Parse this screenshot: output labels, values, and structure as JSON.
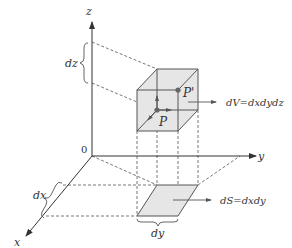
{
  "diagram": {
    "axes": {
      "z_label": "z",
      "y_label": "y",
      "x_label": "x",
      "origin_label": "0"
    },
    "intervals": {
      "dz_label": "dz",
      "dx_label": "dx",
      "dy_label": "dy"
    },
    "points": {
      "P_label": "P",
      "P_prime_label": "P'"
    },
    "annotations": {
      "volume_label": "dV=dxdydz",
      "area_label": "dS=dxdy"
    },
    "colors": {
      "stroke": "#555555",
      "fill": "#e6e6e6",
      "point": "#666666"
    }
  }
}
